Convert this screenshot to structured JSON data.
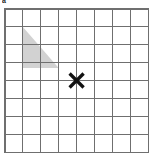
{
  "figure": {
    "label": "a",
    "label_clipped": true,
    "background_color": "#ffffff"
  },
  "grid": {
    "columns": 8,
    "rows": 8,
    "origin_x": 5,
    "origin_y": 9,
    "cell_width": 17.9,
    "cell_height": 17.9,
    "line_color": "#6f6f6f",
    "line_width": 1,
    "border_color": "#6f6f6f",
    "border_width": 1.4
  },
  "shapes": [
    {
      "name": "shaded-triangle",
      "type": "triangle",
      "fill_color": "#d2d2d2",
      "stroke": "none",
      "vertices_grid": [
        {
          "col": 1,
          "row": 1
        },
        {
          "col": 1,
          "row": 3.3
        },
        {
          "col": 3,
          "row": 3.3
        }
      ],
      "vertices_px": [
        {
          "x": 22.9,
          "y": 26.9
        },
        {
          "x": 22.9,
          "y": 68.1
        },
        {
          "x": 58.7,
          "y": 68.1
        }
      ],
      "description": "right triangle, right angle at lower-left"
    },
    {
      "name": "cross-mark",
      "type": "x-mark",
      "color": "#111111",
      "stroke_width": 3.2,
      "arm_length": 7,
      "center_grid": {
        "col": 4,
        "row": 4
      },
      "center_px": {
        "x": 76.6,
        "y": 80.5
      },
      "description": "bold X marker at a grid intersection"
    }
  ],
  "chart_data": {
    "type": "diagram",
    "title": "",
    "grid_on": true,
    "x_range": [
      0,
      8
    ],
    "y_range": [
      0,
      8
    ],
    "annotations": [
      {
        "label": "shaded triangle",
        "points": [
          [
            1,
            1
          ],
          [
            1,
            3.3
          ],
          [
            3,
            3.3
          ]
        ]
      },
      {
        "label": "X point",
        "points": [
          [
            4,
            4
          ]
        ]
      }
    ]
  }
}
